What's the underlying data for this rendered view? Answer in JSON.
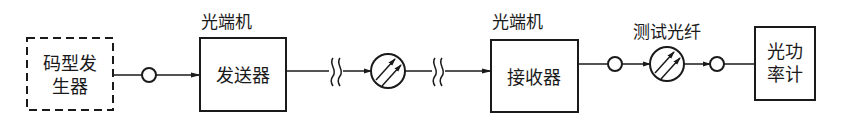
{
  "diagram": {
    "type": "block-diagram",
    "title": "",
    "nodes": {
      "pattern_generator": {
        "line1": "码型发",
        "line2": "生器",
        "style": "dashed"
      },
      "transmitter": {
        "caption": "光端机",
        "label": "发送器"
      },
      "fiber_link": {
        "break_marks": 2,
        "element": "optical-fiber-coil"
      },
      "receiver": {
        "caption": "光端机",
        "label": "接收器"
      },
      "test_fiber": {
        "caption": "测试光纤",
        "element": "optical-fiber-coil"
      },
      "power_meter": {
        "line1": "光功",
        "line2": "率计"
      }
    },
    "connectors": {
      "connector_1": "optical-connector",
      "connector_2": "optical-connector",
      "connector_3": "optical-connector"
    },
    "colors": {
      "line": "#1a1a1a",
      "background": "#ffffff"
    }
  }
}
